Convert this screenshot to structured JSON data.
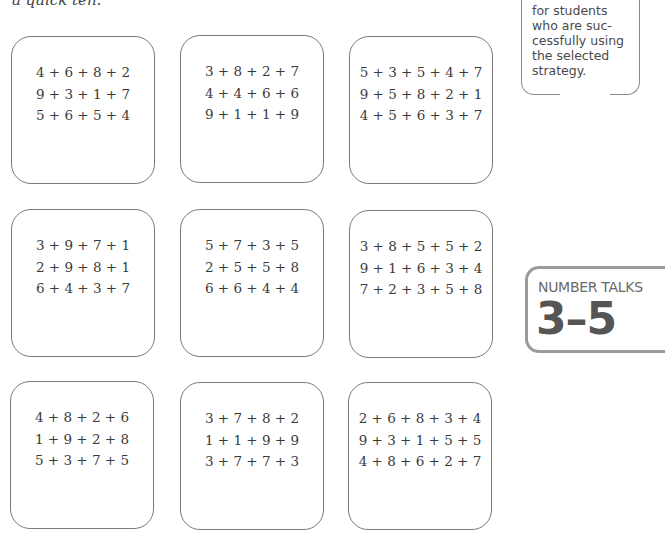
{
  "intro_text": "a quick ten.",
  "callout": {
    "lines": [
      "for students",
      "who are suc-",
      "cessfully using",
      "the selected",
      "strategy."
    ]
  },
  "badge": {
    "title": "NUMBER TALKS",
    "grade": "3–5"
  },
  "cards": [
    {
      "problems": [
        "4 + 6 + 8 + 2",
        "9 + 3 + 1 + 7",
        "5 + 6 + 5 + 4"
      ]
    },
    {
      "problems": [
        "3 + 8 + 2 + 7",
        "4 + 4 + 6 + 6",
        "9 + 1 + 1 + 9"
      ]
    },
    {
      "problems": [
        "5 + 3 + 5 + 4 + 7",
        "9 + 5 + 8 + 2 + 1",
        "4 + 5 + 6 + 3 + 7"
      ]
    },
    {
      "problems": [
        "3 + 9 + 7 + 1",
        "2 + 9 + 8 + 1",
        "6 + 4 + 3 + 7"
      ]
    },
    {
      "problems": [
        "5 + 7 + 3 + 5",
        "2 + 5 + 5 + 8",
        "6 + 6 + 4 + 4"
      ]
    },
    {
      "problems": [
        "3 + 8 + 5 + 5 + 2",
        "9 + 1 + 6 + 3 + 4",
        "7 + 2 + 3 + 5 + 8"
      ]
    },
    {
      "problems": [
        "4 + 8 + 2 + 6",
        "1 + 9 + 2 + 8",
        "5 + 3 + 7 + 5"
      ]
    },
    {
      "problems": [
        "3 + 7 + 8 + 2",
        "1 + 1 + 9 + 9",
        "3 + 7 + 7 + 3"
      ]
    },
    {
      "problems": [
        "2 + 6 + 8 + 3 + 4",
        "9 + 3 + 1 + 5 + 5",
        "4 + 8 + 6 + 2 + 7"
      ]
    }
  ]
}
